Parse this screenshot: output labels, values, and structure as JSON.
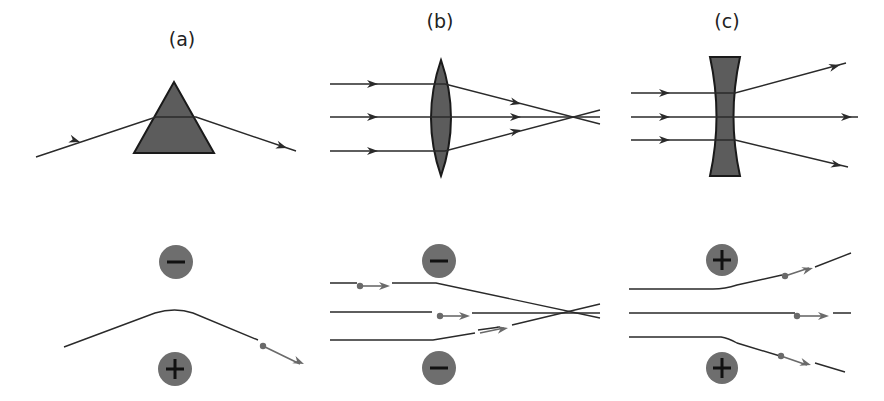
{
  "panels": [
    {
      "id": "a",
      "label": "(a)",
      "label_x": 182,
      "label_y": 38,
      "element": "prism"
    },
    {
      "id": "b",
      "label": "(b)",
      "label_x": 440,
      "label_y": 20,
      "element": "converging-lens"
    },
    {
      "id": "c",
      "label": "(c)",
      "label_x": 727,
      "label_y": 20,
      "element": "diverging-lens"
    }
  ],
  "colors": {
    "line": "#2a2a2a",
    "glass_fill": "#5c5c5c",
    "glass_stroke": "#1a1a1a",
    "charge_fill": "#6e6e6e",
    "charge_sign": "#111111",
    "particle": "#6a6a6a"
  },
  "optics": {
    "prism": {
      "points": [
        [
          174,
          82
        ],
        [
          134,
          153
        ],
        [
          214,
          153
        ]
      ],
      "ray": [
        [
          36,
          157
        ],
        [
          156,
          117
        ],
        [
          196,
          117
        ],
        [
          296,
          151
        ]
      ],
      "arrows": [
        [
          80,
          142,
          18
        ],
        [
          287,
          148,
          18
        ]
      ]
    },
    "converging_lens": {
      "cx": 441,
      "top": 60,
      "bottom": 176,
      "half_width": 10,
      "rays_in": [
        [
          330,
          84
        ],
        [
          330,
          117
        ],
        [
          330,
          151
        ]
      ],
      "rays": [
        [
          [
            330,
            84
          ],
          [
            445,
            84
          ],
          [
            600,
            124
          ]
        ],
        [
          [
            330,
            117
          ],
          [
            600,
            117
          ]
        ],
        [
          [
            330,
            151
          ],
          [
            445,
            151
          ],
          [
            600,
            110
          ]
        ]
      ],
      "arrows": [
        [
          378,
          84,
          0
        ],
        [
          378,
          117,
          0
        ],
        [
          378,
          151,
          0
        ],
        [
          521,
          104,
          14
        ],
        [
          521,
          117,
          0
        ],
        [
          521,
          130,
          -14
        ]
      ]
    },
    "diverging_lens": {
      "cx": 725,
      "top": 57,
      "bottom": 176,
      "rays": [
        [
          [
            631,
            93
          ],
          [
            735,
            93
          ],
          [
            846,
            63
          ]
        ],
        [
          [
            631,
            117
          ],
          [
            858,
            117
          ]
        ],
        [
          [
            631,
            140
          ],
          [
            735,
            140
          ],
          [
            848,
            167
          ]
        ]
      ],
      "arrows": [
        [
          670,
          93,
          0
        ],
        [
          670,
          117,
          0
        ],
        [
          670,
          140,
          0
        ],
        [
          840,
          65,
          -15
        ],
        [
          852,
          117,
          0
        ],
        [
          842,
          166,
          13
        ]
      ]
    }
  },
  "charges": [
    {
      "panel": "a",
      "sign": "-",
      "cx": 176,
      "cy": 262,
      "r": 17
    },
    {
      "panel": "a",
      "sign": "+",
      "cx": 175,
      "cy": 369,
      "r": 17
    },
    {
      "panel": "b",
      "sign": "-",
      "cx": 439,
      "cy": 261,
      "r": 17
    },
    {
      "panel": "b",
      "sign": "-",
      "cx": 439,
      "cy": 368,
      "r": 17
    },
    {
      "panel": "c",
      "sign": "+",
      "cx": 722,
      "cy": 260,
      "r": 16
    },
    {
      "panel": "c",
      "sign": "+",
      "cx": 722,
      "cy": 368,
      "r": 16
    }
  ],
  "trajectories": [
    {
      "panel": "a",
      "path": "M 64 347 L 155 313 Q 175 307 193 313 L 258 340",
      "particle": [
        263,
        346
      ],
      "arrow_to": [
        304,
        364
      ]
    },
    {
      "panel": "b",
      "path": "M 330 283 L 357 283 M 392 283 L 436 283 L 600 318",
      "particle": [
        360,
        286
      ],
      "arrow_to": [
        390,
        286
      ]
    },
    {
      "panel": "b",
      "path": "M 330 312 L 432 312 M 472 313 L 600 313",
      "particle": [
        440,
        316
      ],
      "arrow_to": [
        470,
        316
      ]
    },
    {
      "panel": "b",
      "path": "M 330 340 L 433 340 L 475 333 M 478 330 L 500 327 M 512 325 L 600 304",
      "particle": null,
      "arrow_to": [
        508,
        328
      ]
    },
    {
      "panel": "c",
      "path": "M 629 289 L 713 289 Q 725 289 737 285 L 782 275 M 815 267 L 851 253",
      "particle": [
        785,
        276
      ],
      "arrow_to": [
        813,
        268
      ]
    },
    {
      "panel": "c",
      "path": "M 629 313 L 795 313 M 833 313 L 851 313",
      "particle": [
        797,
        316
      ],
      "arrow_to": [
        829,
        316
      ]
    },
    {
      "panel": "c",
      "path": "M 629 337 L 721 337 Q 728 338 737 343 L 780 356 M 815 363 L 845 372",
      "particle": [
        781,
        356
      ],
      "arrow_to": [
        811,
        365
      ]
    }
  ]
}
